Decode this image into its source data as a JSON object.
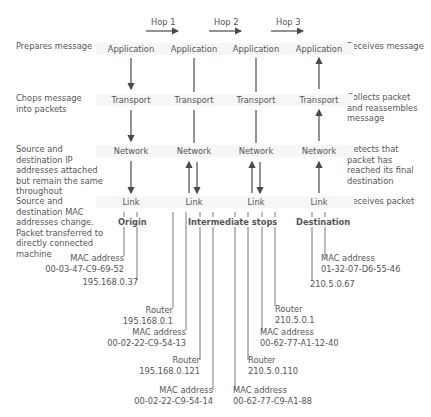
{
  "hops": [
    "Hop 1",
    "Hop 2",
    "Hop 3"
  ],
  "layers": {
    "application": "Application",
    "transport": "Transport",
    "network": "Network",
    "link": "Link"
  },
  "left_descriptions": [
    "Prepares message",
    "Chops message into packets",
    "Source and destination IP addresses attached but remain the same throughout",
    "Source and destination MAC addresses change. Packet transferred to directly connected machine"
  ],
  "right_descriptions": [
    "Receives message",
    "Collects packet and reassembles message",
    "Detects that packet has reached its final destination",
    "Receives packet"
  ],
  "nodes": {
    "origin": "Origin",
    "intermediate": "Intermediate stops",
    "destination": "Destination"
  },
  "addresses": {
    "origin_mac_label": "MAC address",
    "origin_mac": "00-03-47-C9-69-52",
    "origin_ip": "195.168.0.37",
    "router1_label": "Router",
    "router1_ip": "195.168.0.1",
    "router1_mac_label": "MAC address",
    "router1_mac": "00-02-22-C9-54-13",
    "router2_label": "Router",
    "router2_ip": "195.168.0.121",
    "router2_mac_label": "MAC address",
    "router2_mac": "00-02-22-C9-54-14",
    "router3_label": "Router",
    "router3_ip": "210.5.0.1",
    "router3_mac_label": "MAC address",
    "router3_mac": "00-62-77-A1-12-40",
    "router4_label": "Router",
    "router4_ip": "210.5.0.110",
    "router4_mac_label": "MAC address",
    "router4_mac": "00-62-77-C9-A1-88",
    "dest_mac_label": "MAC address",
    "dest_mac": "01-32-07-D6-55-46",
    "dest_ip": "210.5.0.67"
  },
  "colors": {
    "line": "#4a4a4a",
    "box": "#f6f6f6",
    "text": "#555555"
  }
}
